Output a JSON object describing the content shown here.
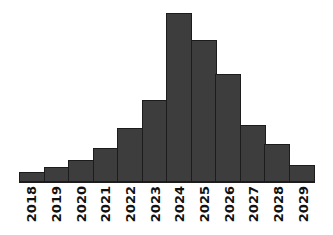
{
  "chart_data": {
    "type": "bar",
    "title": "",
    "subtitle": "",
    "xlabel": "",
    "ylabel": "",
    "categories": [
      "2018",
      "2019",
      "2020",
      "2021",
      "2022",
      "2023",
      "2024",
      "2025",
      "2026",
      "2027",
      "2028",
      "2029"
    ],
    "values": [
      10,
      15,
      22,
      34,
      54,
      82,
      169,
      142,
      108,
      57,
      38,
      17
    ],
    "series": [
      {
        "name": "",
        "values": [
          10,
          15,
          22,
          34,
          54,
          82,
          169,
          142,
          108,
          57,
          38,
          17
        ]
      }
    ],
    "ylim": [
      0,
      175
    ],
    "grid": false,
    "legend": false,
    "legend_position": "none",
    "annotations": [],
    "bar_color": "#3d3d3d",
    "bar_edge_color": "#1c1c1c",
    "axis_color": "#1c1c1c",
    "background_color": "#ffffff",
    "tick_label_rotation": 90,
    "yaxis_visible": false,
    "ytick_labels": []
  }
}
